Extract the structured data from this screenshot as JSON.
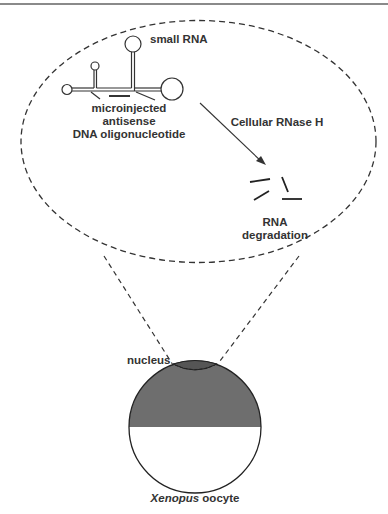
{
  "figure": {
    "labels": {
      "small_rna": "small RNA",
      "oligo_line1": "microinjected",
      "oligo_line2": "antisense",
      "oligo_line3": "DNA oligonucleotide",
      "enzyme": "Cellular RNase H",
      "result_line1": "RNA",
      "result_line2": "degradation",
      "nucleus": "nucleus",
      "cell_italic": "Xenopus",
      "cell_rest": " oocyte"
    },
    "colors": {
      "line": "#333333",
      "dashed": "#333333",
      "animal_pole": "#6e6e6e",
      "nucleus": "#555555",
      "vegetal_pole": "#ffffff",
      "top_rule": "#8a8a8a"
    }
  }
}
